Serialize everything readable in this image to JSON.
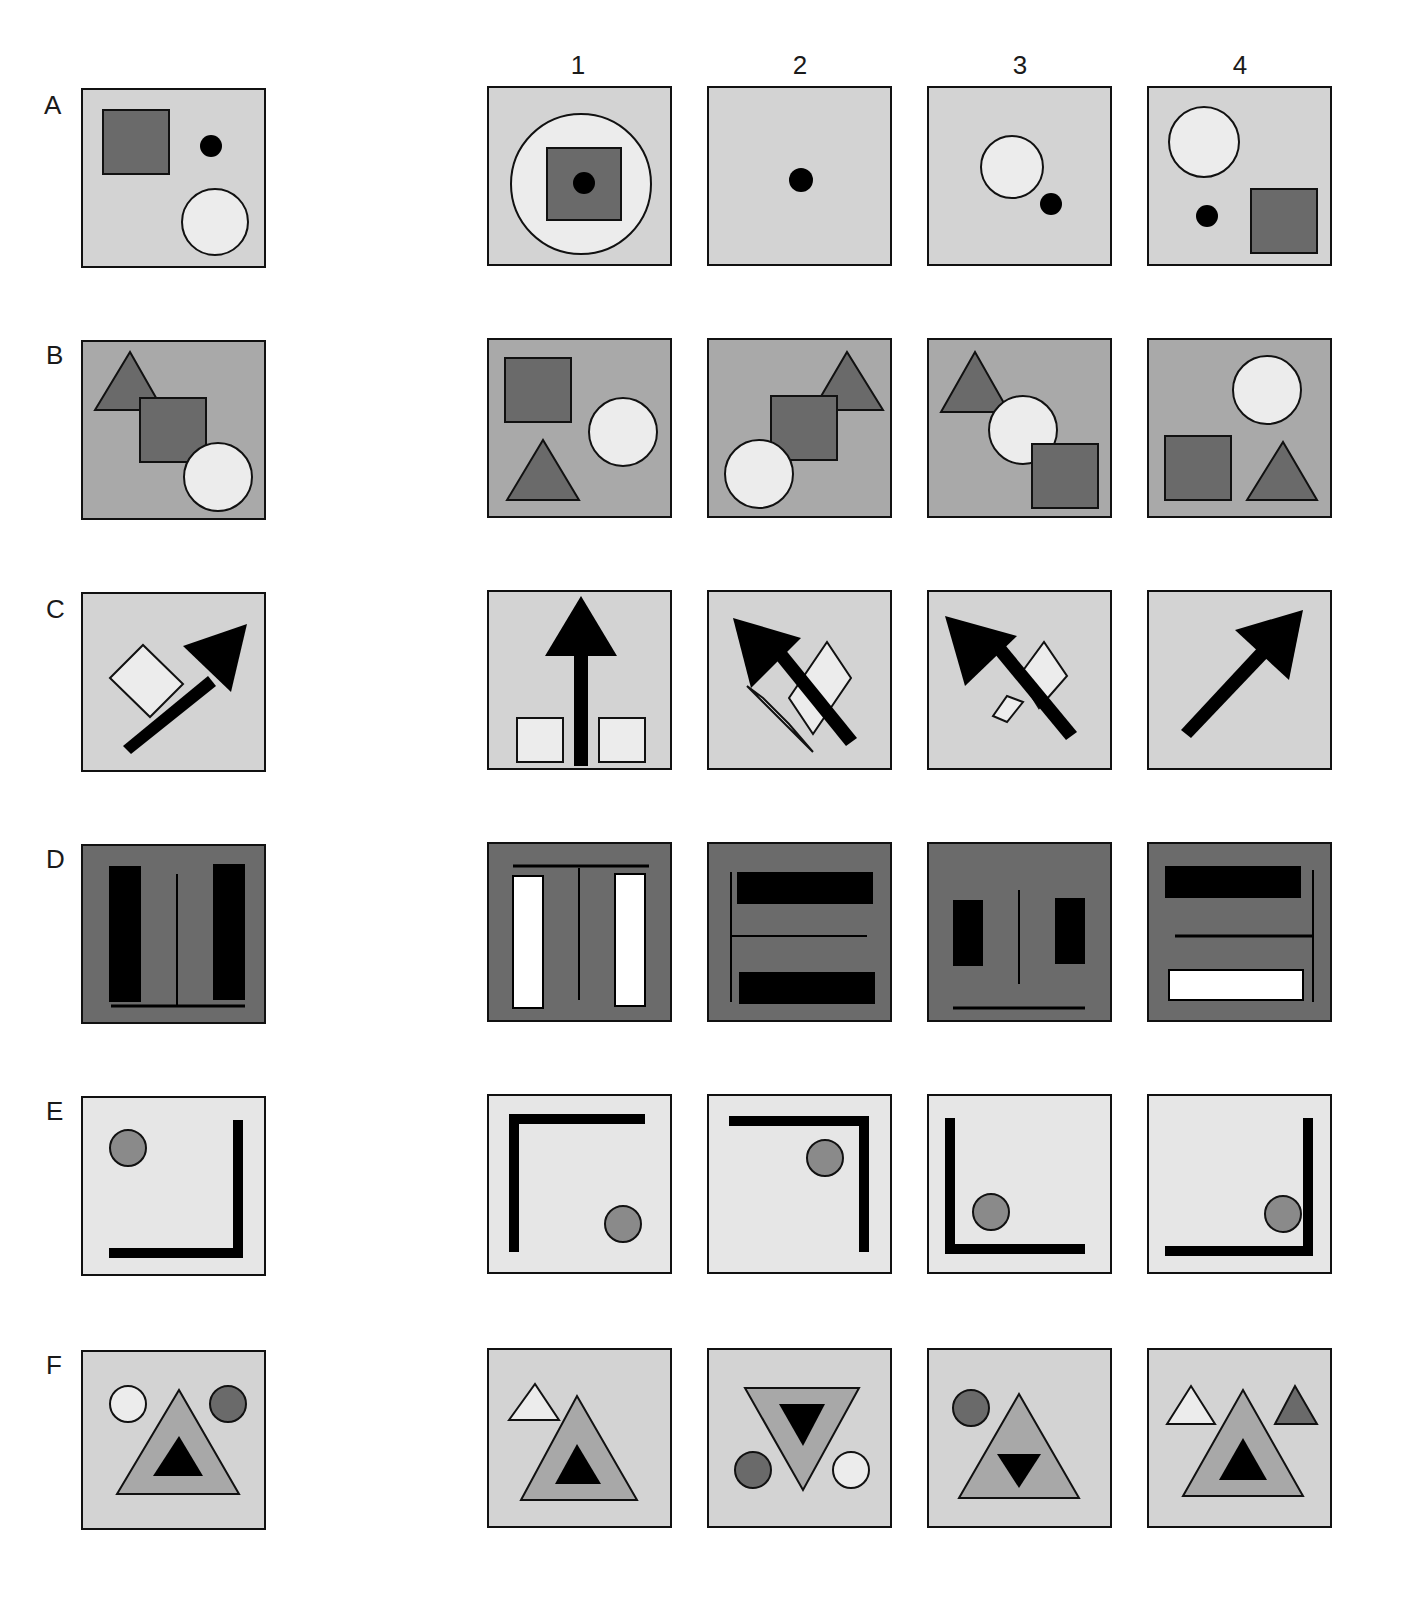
{
  "colors": {
    "light_bg": "#d3d3d3",
    "mid_bg": "#a9a9a9",
    "dark_bg": "#6b6b6b",
    "pale_bg": "#e6e6e6",
    "dark_shape": "#6a6a6a",
    "mid_shape": "#8a8a8a",
    "light_shape": "#ececec",
    "tri_mid": "#a8a8a8",
    "black": "#000000",
    "white": "#ffffff"
  },
  "column_labels": [
    "1",
    "2",
    "3",
    "4"
  ],
  "rows": [
    {
      "label": "A",
      "bg": "#d3d3d3",
      "sample": [
        {
          "t": "rect",
          "x": 20,
          "y": 20,
          "w": 66,
          "h": 64,
          "fill": "#6a6a6a",
          "stroke": "#111",
          "sw": 2
        },
        {
          "t": "circle",
          "cx": 128,
          "cy": 56,
          "r": 11,
          "fill": "#000"
        },
        {
          "t": "circle",
          "cx": 132,
          "cy": 132,
          "r": 33,
          "fill": "#ececec",
          "stroke": "#111",
          "sw": 2
        }
      ],
      "options": [
        [
          {
            "t": "circle",
            "cx": 92,
            "cy": 96,
            "r": 70,
            "fill": "#ececec",
            "stroke": "#111",
            "sw": 2
          },
          {
            "t": "rect",
            "x": 58,
            "y": 60,
            "w": 74,
            "h": 72,
            "fill": "#6a6a6a",
            "stroke": "#111",
            "sw": 2
          },
          {
            "t": "circle",
            "cx": 95,
            "cy": 95,
            "r": 11,
            "fill": "#000"
          }
        ],
        [
          {
            "t": "circle",
            "cx": 92,
            "cy": 92,
            "r": 12,
            "fill": "#000"
          }
        ],
        [
          {
            "t": "circle",
            "cx": 83,
            "cy": 79,
            "r": 31,
            "fill": "#ececec",
            "stroke": "#111",
            "sw": 2
          },
          {
            "t": "circle",
            "cx": 122,
            "cy": 116,
            "r": 11,
            "fill": "#000"
          }
        ],
        [
          {
            "t": "circle",
            "cx": 55,
            "cy": 54,
            "r": 35,
            "fill": "#ececec",
            "stroke": "#111",
            "sw": 2
          },
          {
            "t": "circle",
            "cx": 58,
            "cy": 128,
            "r": 11,
            "fill": "#000"
          },
          {
            "t": "rect",
            "x": 102,
            "y": 101,
            "w": 66,
            "h": 64,
            "fill": "#6a6a6a",
            "stroke": "#111",
            "sw": 2
          }
        ]
      ]
    },
    {
      "label": "B",
      "bg": "#a9a9a9",
      "sample": [
        {
          "t": "poly",
          "pts": "12,68 47,10 80,68",
          "fill": "#6a6a6a",
          "stroke": "#111",
          "sw": 2
        },
        {
          "t": "rect",
          "x": 57,
          "y": 56,
          "w": 66,
          "h": 64,
          "fill": "#6a6a6a",
          "stroke": "#111",
          "sw": 2
        },
        {
          "t": "circle",
          "cx": 135,
          "cy": 135,
          "r": 34,
          "fill": "#ececec",
          "stroke": "#111",
          "sw": 2
        }
      ],
      "options": [
        [
          {
            "t": "rect",
            "x": 16,
            "y": 18,
            "w": 66,
            "h": 64,
            "fill": "#6a6a6a",
            "stroke": "#111",
            "sw": 2
          },
          {
            "t": "circle",
            "cx": 134,
            "cy": 92,
            "r": 34,
            "fill": "#ececec",
            "stroke": "#111",
            "sw": 2
          },
          {
            "t": "poly",
            "pts": "18,160 54,100 90,160",
            "fill": "#6a6a6a",
            "stroke": "#111",
            "sw": 2
          }
        ],
        [
          {
            "t": "poly",
            "pts": "104,70 138,12 174,70",
            "fill": "#6a6a6a",
            "stroke": "#111",
            "sw": 2
          },
          {
            "t": "rect",
            "x": 62,
            "y": 56,
            "w": 66,
            "h": 64,
            "fill": "#6a6a6a",
            "stroke": "#111",
            "sw": 2
          },
          {
            "t": "circle",
            "cx": 50,
            "cy": 134,
            "r": 34,
            "fill": "#ececec",
            "stroke": "#111",
            "sw": 2
          }
        ],
        [
          {
            "t": "poly",
            "pts": "12,72 46,12 80,72",
            "fill": "#6a6a6a",
            "stroke": "#111",
            "sw": 2
          },
          {
            "t": "circle",
            "cx": 94,
            "cy": 90,
            "r": 34,
            "fill": "#ececec",
            "stroke": "#111",
            "sw": 2
          },
          {
            "t": "rect",
            "x": 103,
            "y": 104,
            "w": 66,
            "h": 64,
            "fill": "#6a6a6a",
            "stroke": "#111",
            "sw": 2
          }
        ],
        [
          {
            "t": "circle",
            "cx": 118,
            "cy": 50,
            "r": 34,
            "fill": "#ececec",
            "stroke": "#111",
            "sw": 2
          },
          {
            "t": "rect",
            "x": 16,
            "y": 96,
            "w": 66,
            "h": 64,
            "fill": "#6a6a6a",
            "stroke": "#111",
            "sw": 2
          },
          {
            "t": "poly",
            "pts": "98,160 134,102 168,160",
            "fill": "#6a6a6a",
            "stroke": "#111",
            "sw": 2
          }
        ]
      ]
    },
    {
      "label": "C",
      "bg": "#d3d3d3",
      "sample": [
        {
          "t": "poly",
          "pts": "27,84 60,51 100,90 67,123",
          "fill": "#ececec",
          "stroke": "#111",
          "sw": 2
        },
        {
          "t": "poly",
          "pts": "40,152 125,82 133,92 48,160",
          "fill": "#000"
        },
        {
          "t": "poly",
          "pts": "100,52 164,30 148,98",
          "fill": "#000"
        }
      ],
      "options": [
        [
          {
            "t": "rect",
            "x": 28,
            "y": 126,
            "w": 46,
            "h": 44,
            "fill": "#ececec",
            "stroke": "#111",
            "sw": 2
          },
          {
            "t": "rect",
            "x": 110,
            "y": 126,
            "w": 46,
            "h": 44,
            "fill": "#ececec",
            "stroke": "#111",
            "sw": 2
          },
          {
            "t": "rect",
            "x": 85,
            "y": 62,
            "w": 14,
            "h": 112,
            "fill": "#000"
          },
          {
            "t": "poly",
            "pts": "56,64 92,4 128,64",
            "fill": "#000"
          }
        ],
        [
          {
            "t": "poly",
            "pts": "80,106 118,50 142,86 104,142",
            "fill": "#ececec",
            "stroke": "#111",
            "sw": 2
          },
          {
            "t": "poly",
            "pts": "54,106 80,132 104,160 38,94",
            "fill": "#ececec",
            "stroke": "#111",
            "sw": 2
          },
          {
            "t": "poly",
            "pts": "56,54 67,46 148,146 137,154",
            "fill": "#000"
          },
          {
            "t": "poly",
            "pts": "24,26 92,46 42,96",
            "fill": "#000"
          }
        ],
        [
          {
            "t": "poly",
            "pts": "90,84 115,50 138,84 110,116",
            "fill": "#ececec",
            "stroke": "#111",
            "sw": 2
          },
          {
            "t": "poly",
            "pts": "64,124 78,104 94,110 78,130",
            "fill": "#ececec",
            "stroke": "#111",
            "sw": 2
          },
          {
            "t": "poly",
            "pts": "56,50 67,42 148,140 137,148",
            "fill": "#000"
          },
          {
            "t": "poly",
            "pts": "16,24 88,44 36,94",
            "fill": "#000"
          }
        ],
        [
          {
            "t": "poly",
            "pts": "32,138 112,52 122,62 42,146",
            "fill": "#000"
          },
          {
            "t": "poly",
            "pts": "86,38 154,18 140,88",
            "fill": "#000"
          }
        ]
      ]
    },
    {
      "label": "D",
      "bg": "#6b6b6b",
      "sample": [
        {
          "t": "rect",
          "x": 26,
          "y": 20,
          "w": 32,
          "h": 136,
          "fill": "#000"
        },
        {
          "t": "rect",
          "x": 130,
          "y": 18,
          "w": 32,
          "h": 136,
          "fill": "#000"
        },
        {
          "t": "line",
          "x1": 94,
          "y1": 28,
          "x2": 94,
          "y2": 160,
          "stroke": "#000",
          "sw": 2
        },
        {
          "t": "line",
          "x1": 28,
          "y1": 160,
          "x2": 162,
          "y2": 160,
          "stroke": "#000",
          "sw": 3
        }
      ],
      "options": [
        [
          {
            "t": "line",
            "x1": 24,
            "y1": 22,
            "x2": 160,
            "y2": 22,
            "stroke": "#000",
            "sw": 3
          },
          {
            "t": "rect",
            "x": 24,
            "y": 32,
            "w": 30,
            "h": 132,
            "fill": "#ffffff",
            "stroke": "#000",
            "sw": 2
          },
          {
            "t": "rect",
            "x": 126,
            "y": 30,
            "w": 30,
            "h": 132,
            "fill": "#ffffff",
            "stroke": "#000",
            "sw": 2
          },
          {
            "t": "line",
            "x1": 90,
            "y1": 24,
            "x2": 90,
            "y2": 156,
            "stroke": "#000",
            "sw": 2
          }
        ],
        [
          {
            "t": "line",
            "x1": 22,
            "y1": 28,
            "x2": 22,
            "y2": 158,
            "stroke": "#000",
            "sw": 2
          },
          {
            "t": "rect",
            "x": 28,
            "y": 28,
            "w": 136,
            "h": 32,
            "fill": "#000"
          },
          {
            "t": "line",
            "x1": 22,
            "y1": 92,
            "x2": 158,
            "y2": 92,
            "stroke": "#000",
            "sw": 2
          },
          {
            "t": "rect",
            "x": 30,
            "y": 128,
            "w": 136,
            "h": 32,
            "fill": "#000"
          }
        ],
        [
          {
            "t": "rect",
            "x": 24,
            "y": 56,
            "w": 30,
            "h": 66,
            "fill": "#000"
          },
          {
            "t": "rect",
            "x": 126,
            "y": 54,
            "w": 30,
            "h": 66,
            "fill": "#000"
          },
          {
            "t": "line",
            "x1": 90,
            "y1": 46,
            "x2": 90,
            "y2": 140,
            "stroke": "#000",
            "sw": 2
          },
          {
            "t": "line",
            "x1": 24,
            "y1": 164,
            "x2": 156,
            "y2": 164,
            "stroke": "#000",
            "sw": 3
          }
        ],
        [
          {
            "t": "rect",
            "x": 16,
            "y": 22,
            "w": 136,
            "h": 32,
            "fill": "#000"
          },
          {
            "t": "line",
            "x1": 164,
            "y1": 26,
            "x2": 164,
            "y2": 158,
            "stroke": "#000",
            "sw": 2
          },
          {
            "t": "line",
            "x1": 26,
            "y1": 92,
            "x2": 164,
            "y2": 92,
            "stroke": "#000",
            "sw": 3
          },
          {
            "t": "rect",
            "x": 20,
            "y": 126,
            "w": 134,
            "h": 30,
            "fill": "#ffffff",
            "stroke": "#000",
            "sw": 2
          }
        ]
      ]
    },
    {
      "label": "E",
      "bg": "#e6e6e6",
      "sample": [
        {
          "t": "circle",
          "cx": 45,
          "cy": 50,
          "r": 18,
          "fill": "#8a8a8a",
          "stroke": "#111",
          "sw": 2
        },
        {
          "t": "rect",
          "x": 150,
          "y": 22,
          "w": 10,
          "h": 138,
          "fill": "#000"
        },
        {
          "t": "rect",
          "x": 26,
          "y": 150,
          "w": 134,
          "h": 10,
          "fill": "#000"
        }
      ],
      "options": [
        [
          {
            "t": "rect",
            "x": 20,
            "y": 18,
            "w": 136,
            "h": 10,
            "fill": "#000"
          },
          {
            "t": "rect",
            "x": 20,
            "y": 18,
            "w": 10,
            "h": 138,
            "fill": "#000"
          },
          {
            "t": "circle",
            "cx": 134,
            "cy": 128,
            "r": 18,
            "fill": "#8a8a8a",
            "stroke": "#111",
            "sw": 2
          }
        ],
        [
          {
            "t": "rect",
            "x": 20,
            "y": 20,
            "w": 140,
            "h": 10,
            "fill": "#000"
          },
          {
            "t": "rect",
            "x": 150,
            "y": 20,
            "w": 10,
            "h": 136,
            "fill": "#000"
          },
          {
            "t": "circle",
            "cx": 116,
            "cy": 62,
            "r": 18,
            "fill": "#8a8a8a",
            "stroke": "#111",
            "sw": 2
          }
        ],
        [
          {
            "t": "rect",
            "x": 16,
            "y": 22,
            "w": 10,
            "h": 136,
            "fill": "#000"
          },
          {
            "t": "rect",
            "x": 16,
            "y": 148,
            "w": 140,
            "h": 10,
            "fill": "#000"
          },
          {
            "t": "circle",
            "cx": 62,
            "cy": 116,
            "r": 18,
            "fill": "#8a8a8a",
            "stroke": "#111",
            "sw": 2
          }
        ],
        [
          {
            "t": "rect",
            "x": 154,
            "y": 22,
            "w": 10,
            "h": 138,
            "fill": "#000"
          },
          {
            "t": "rect",
            "x": 16,
            "y": 150,
            "w": 148,
            "h": 10,
            "fill": "#000"
          },
          {
            "t": "circle",
            "cx": 134,
            "cy": 118,
            "r": 18,
            "fill": "#8a8a8a",
            "stroke": "#111",
            "sw": 2
          }
        ]
      ]
    },
    {
      "label": "F",
      "bg": "#d3d3d3",
      "sample": [
        {
          "t": "circle",
          "cx": 45,
          "cy": 52,
          "r": 18,
          "fill": "#ececec",
          "stroke": "#111",
          "sw": 2
        },
        {
          "t": "circle",
          "cx": 145,
          "cy": 52,
          "r": 18,
          "fill": "#6a6a6a",
          "stroke": "#111",
          "sw": 2
        },
        {
          "t": "poly",
          "pts": "34,142 96,38 156,142",
          "fill": "#a8a8a8",
          "stroke": "#111",
          "sw": 2
        },
        {
          "t": "poly",
          "pts": "70,124 96,84 120,124",
          "fill": "#000"
        }
      ],
      "options": [
        [
          {
            "t": "poly",
            "pts": "20,70 46,34 70,70",
            "fill": "#ececec",
            "stroke": "#111",
            "sw": 2
          },
          {
            "t": "poly",
            "pts": "32,150 88,46 148,150",
            "fill": "#a8a8a8",
            "stroke": "#111",
            "sw": 2
          },
          {
            "t": "poly",
            "pts": "66,134 88,94 112,134",
            "fill": "#000"
          }
        ],
        [
          {
            "t": "poly",
            "pts": "36,38 150,38 94,140",
            "fill": "#a8a8a8",
            "stroke": "#111",
            "sw": 2
          },
          {
            "t": "poly",
            "pts": "70,54 116,54 94,96",
            "fill": "#000"
          },
          {
            "t": "circle",
            "cx": 44,
            "cy": 120,
            "r": 18,
            "fill": "#6a6a6a",
            "stroke": "#111",
            "sw": 2
          },
          {
            "t": "circle",
            "cx": 142,
            "cy": 120,
            "r": 18,
            "fill": "#ececec",
            "stroke": "#111",
            "sw": 2
          }
        ],
        [
          {
            "t": "circle",
            "cx": 42,
            "cy": 58,
            "r": 18,
            "fill": "#6a6a6a",
            "stroke": "#111",
            "sw": 2
          },
          {
            "t": "poly",
            "pts": "30,148 90,44 150,148",
            "fill": "#a8a8a8",
            "stroke": "#111",
            "sw": 2
          },
          {
            "t": "poly",
            "pts": "68,104 112,104 90,138",
            "fill": "#000"
          }
        ],
        [
          {
            "t": "poly",
            "pts": "18,74 42,36 66,74",
            "fill": "#ececec",
            "stroke": "#111",
            "sw": 2
          },
          {
            "t": "poly",
            "pts": "126,74 146,36 168,74",
            "fill": "#6a6a6a",
            "stroke": "#111",
            "sw": 2
          },
          {
            "t": "poly",
            "pts": "34,146 94,40 154,146",
            "fill": "#a8a8a8",
            "stroke": "#111",
            "sw": 2
          },
          {
            "t": "poly",
            "pts": "70,130 94,88 118,130",
            "fill": "#000"
          }
        ]
      ]
    }
  ]
}
